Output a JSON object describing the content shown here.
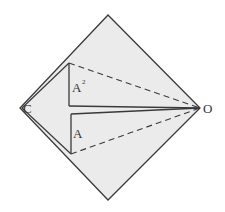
{
  "diagram": {
    "type": "geometric-construction",
    "colors": {
      "fill": "#ebebeb",
      "stroke": "#3a3a3a",
      "background": "#ffffff"
    },
    "labels": {
      "left_vertex": "C",
      "right_vertex": "O",
      "upper_triangle": "A",
      "upper_triangle_sup": "2",
      "lower_triangle": "A"
    },
    "shapes": {
      "diamond": [
        [
          108,
          15
        ],
        [
          200,
          108
        ],
        [
          108,
          200
        ],
        [
          20,
          108
        ]
      ],
      "upper_triangle": {
        "apex": [
          69,
          63
        ],
        "base": [
          69,
          106
        ],
        "tip": [
          200,
          108
        ]
      },
      "lower_triangle": {
        "apex": [
          71,
          154
        ],
        "base": [
          71,
          114
        ],
        "tip": [
          200,
          108
        ]
      }
    }
  }
}
